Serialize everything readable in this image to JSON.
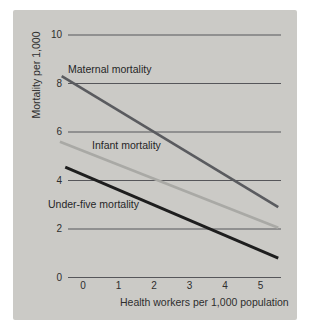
{
  "figure": {
    "ylabel": "Mortality per 1,000",
    "xlabel": "Health workers per 1,000 population"
  },
  "colors": {
    "page_bg": "#ffffff",
    "panel_bg": "#cbcac6",
    "grid": "#56565a",
    "text": "#2e2e2e"
  },
  "chart_data": {
    "type": "line",
    "title": "",
    "xlabel": "Health workers per 1,000 population",
    "ylabel": "Mortality per 1,000",
    "x_ticks": [
      0,
      1,
      2,
      3,
      4,
      5
    ],
    "y_ticks": [
      10,
      8,
      6,
      4,
      2,
      0
    ],
    "xlim": [
      -0.62,
      5.62
    ],
    "ylim": [
      0,
      10.5
    ],
    "grid": "horizontal-only",
    "legend": "inline-labels-near-lines",
    "series": [
      {
        "name": "Maternal mortality",
        "color": "#5a5b5f",
        "stroke_width": 2.6,
        "points": [
          {
            "x": -0.6,
            "y": 8.3
          },
          {
            "x": 5.5,
            "y": 2.9
          }
        ]
      },
      {
        "name": "Infant mortality",
        "color": "#a9a9a5",
        "stroke_width": 2.6,
        "points": [
          {
            "x": -0.65,
            "y": 5.6
          },
          {
            "x": 5.5,
            "y": 2.05
          }
        ]
      },
      {
        "name": "Under-five mortality",
        "color": "#1e1e1e",
        "stroke_width": 2.8,
        "points": [
          {
            "x": -0.5,
            "y": 4.55
          },
          {
            "x": 5.5,
            "y": 0.8
          }
        ]
      }
    ]
  }
}
